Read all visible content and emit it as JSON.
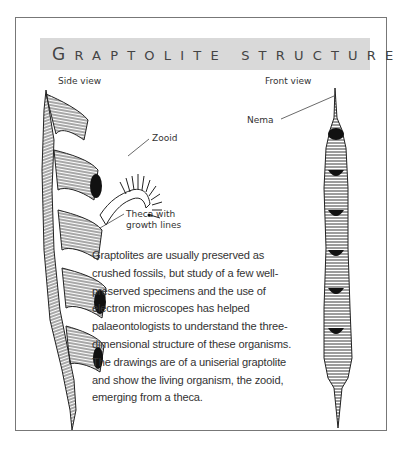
{
  "title": {
    "first_letter": "G",
    "rest": "RAPTOLITE STRUCTURE",
    "full": "Graptolite structure"
  },
  "views": {
    "side": {
      "label": "Side view",
      "annotations": [
        {
          "label": "Zooid"
        },
        {
          "label_line1": "Theca with",
          "label_line2": "growth lines"
        }
      ]
    },
    "front": {
      "label": "Front view",
      "annotations": [
        {
          "label": "Nema"
        }
      ]
    }
  },
  "description": "Graptolites are usually preserved as crushed fossils, but study of a few well-preserved specimens and the use of electron microscopes has helped palaeontologists to understand the three-dimensional structure of these organisms. The drawings are of a uniserial graptolite and show the living organism, the zooid, emerging from a theca.",
  "colors": {
    "title_bar": "#d9d9d9",
    "frame_border": "#777777",
    "text": "#333333"
  }
}
